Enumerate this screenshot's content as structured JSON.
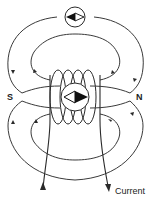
{
  "diagram": {
    "labels": {
      "south_pole": "S",
      "north_pole": "N",
      "current": "Current"
    },
    "elements": {
      "compass_top": "compass with needle pointing left (outside solenoid)",
      "compass_center": "compass with needle pointing right (inside solenoid)",
      "coil_turns": 4,
      "field_line_loops_upper": 2,
      "field_line_loops_lower": 2
    },
    "colors": {
      "line": "#3a3a3a",
      "background": "#ffffff",
      "needle_dark": "#111111"
    }
  }
}
